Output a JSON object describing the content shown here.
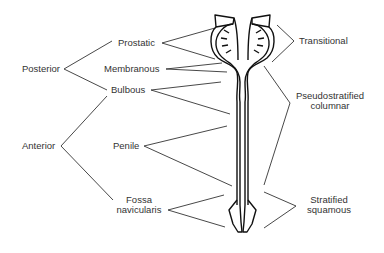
{
  "diagram": {
    "left_groups": [
      {
        "label": "Posterior",
        "children": [
          "Prostatic",
          "Membranous",
          "Bulbous"
        ]
      },
      {
        "label": "Anterior",
        "children": [
          "Bulbous",
          "Penile",
          "Fossa navicularis"
        ]
      }
    ],
    "regions": [
      {
        "label": "Prostatic"
      },
      {
        "label": "Membranous"
      },
      {
        "label": "Bulbous"
      },
      {
        "label": "Penile"
      },
      {
        "label": "Fossa navicularis",
        "line1": "Fossa",
        "line2": "navicularis"
      }
    ],
    "epithelium": [
      {
        "label": "Transitional"
      },
      {
        "label": "Pseudostratified columnar",
        "line1": "Pseudostratified",
        "line2": "columnar"
      },
      {
        "label": "Stratified squamous",
        "line1": "Stratified",
        "line2": "squamous"
      }
    ],
    "colors": {
      "line": "#333333",
      "outline": "#111111",
      "background": "#ffffff"
    }
  }
}
